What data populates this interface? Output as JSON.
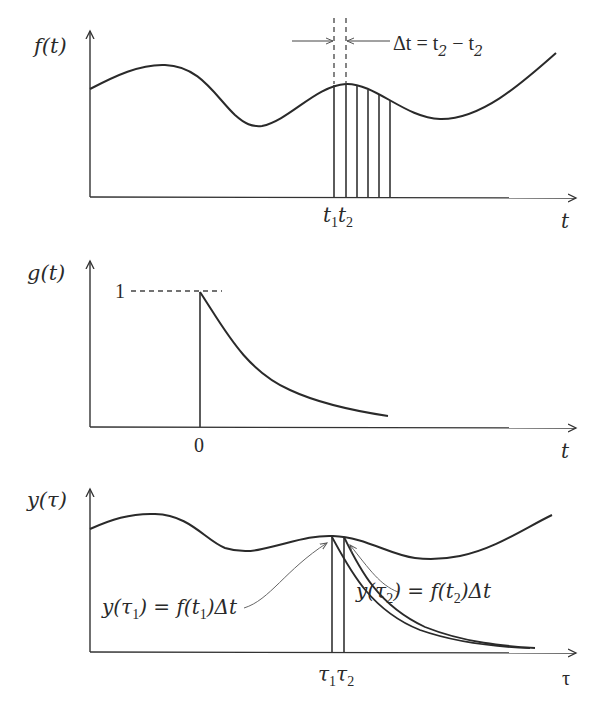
{
  "diagram": {
    "panel_f": {
      "ylabel": "f(t)",
      "xlabel": "t",
      "annotation_delta": "Δt = t",
      "annotation_sub1": "2",
      "annotation_minus": " − t",
      "annotation_sub2": "2",
      "tick_t1": "t",
      "tick_t1_sub": "1",
      "tick_t2": "t",
      "tick_t2_sub": "2"
    },
    "panel_g": {
      "ylabel": "g(t)",
      "xlabel": "t",
      "level_label": "1",
      "origin_label": "0"
    },
    "panel_y": {
      "ylabel": "y(τ)",
      "xlabel": "τ",
      "tick_tau1": "τ",
      "tick_tau1_sub": "1",
      "tick_tau2": "τ",
      "tick_tau2_sub": "2",
      "annotation_left": {
        "pre": "y(τ",
        "sub": "1",
        "mid": ") = f(t",
        "sub2": "1",
        "post": ")Δt"
      },
      "annotation_right": {
        "pre": "y(τ",
        "sub": "2",
        "mid": ") = f(t",
        "sub2": "2",
        "post": ")Δt"
      }
    },
    "colors": {
      "stroke": "#2a2a2a",
      "background": "#ffffff"
    }
  }
}
